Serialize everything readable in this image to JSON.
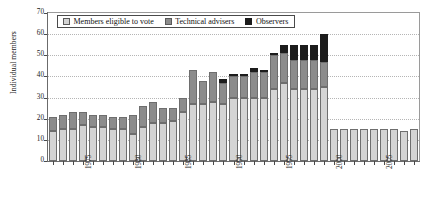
{
  "chart_data": {
    "type": "bar",
    "stacked": true,
    "title": "",
    "xlabel": "",
    "ylabel": "Individual members",
    "ylim": [
      0,
      70
    ],
    "ytick_values": [
      0,
      10,
      20,
      30,
      40,
      50,
      60,
      70
    ],
    "ytick_labels": [
      "0",
      "10",
      "20",
      "30",
      "40",
      "50",
      "60",
      "70"
    ],
    "xtick_labels": [
      "1975",
      "1980",
      "1985",
      "1990",
      "1995",
      "2000",
      "2005"
    ],
    "xtick_years": [
      1975,
      1980,
      1985,
      1990,
      1995,
      2000,
      2005
    ],
    "grid": "horizontal-dotted",
    "legend_position": "top-left-inside",
    "categories": [
      1972,
      1973,
      1974,
      1975,
      1976,
      1977,
      1978,
      1979,
      1980,
      1981,
      1982,
      1983,
      1984,
      1985,
      1986,
      1987,
      1988,
      1989,
      1990,
      1991,
      1992,
      1993,
      1994,
      1995,
      1996,
      1997,
      1998,
      1999,
      2000,
      2001,
      2002,
      2003,
      2004,
      2005,
      2006,
      2007,
      2008
    ],
    "series": [
      {
        "name": "Members eligible to vote",
        "color": "#d4d4d4",
        "values": [
          14,
          15,
          15,
          17,
          16,
          16,
          15,
          15,
          13,
          16,
          18,
          18,
          19,
          23,
          27,
          27,
          28,
          27,
          30,
          30,
          30,
          30,
          34,
          37,
          34,
          34,
          34,
          35,
          15,
          15,
          15,
          15,
          15,
          15,
          15,
          14,
          15
        ]
      },
      {
        "name": "Technical advisers",
        "color": "#8c8c8c",
        "values": [
          7,
          7,
          8,
          6,
          6,
          6,
          6,
          6,
          9,
          10,
          10,
          7,
          6,
          7,
          16,
          11,
          14,
          10,
          10,
          10,
          12,
          12,
          16,
          14,
          14,
          14,
          14,
          12,
          0,
          0,
          0,
          0,
          0,
          0,
          0,
          0,
          0
        ]
      },
      {
        "name": "Observers",
        "color": "#1c1c1c",
        "values": [
          0,
          0,
          0,
          0,
          0,
          0,
          0,
          0,
          0,
          0,
          0,
          0,
          0,
          0,
          0,
          0,
          0,
          2,
          1,
          1,
          2,
          1,
          1,
          4,
          7,
          7,
          7,
          13,
          0,
          0,
          0,
          0,
          0,
          0,
          0,
          0,
          0
        ]
      }
    ],
    "totals": [
      21,
      22,
      23,
      23,
      22,
      22,
      21,
      21,
      22,
      26,
      28,
      25,
      25,
      30,
      43,
      38,
      42,
      39,
      41,
      41,
      44,
      43,
      51,
      55,
      55,
      55,
      55,
      60,
      15,
      15,
      15,
      15,
      15,
      15,
      15,
      14,
      15
    ]
  },
  "legend": {
    "items": [
      {
        "label": "Members eligible to vote",
        "swatch": "votes"
      },
      {
        "label": "Technical advisers",
        "swatch": "advisers"
      },
      {
        "label": "Observers",
        "swatch": "observers"
      }
    ]
  },
  "axes": {
    "y_axis_title": "Individual members"
  },
  "colors": {
    "votes": "#d4d4d4",
    "advisers": "#8c8c8c",
    "observers": "#1c1c1c",
    "axis": "#6b6b6b",
    "grid": "#b5b5b5"
  }
}
